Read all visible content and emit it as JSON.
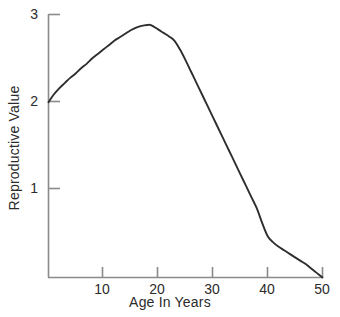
{
  "chart_data": {
    "type": "line",
    "title": "",
    "xlabel": "Age In Years",
    "ylabel": "Reproductive Value",
    "xlim": [
      0,
      50
    ],
    "ylim": [
      0,
      3
    ],
    "grid": false,
    "legend": null,
    "line_color": "#2e2e2e",
    "axis_color": "#8a8a8a",
    "background_color": "#ffffff",
    "xticks": [
      10,
      20,
      30,
      40,
      50
    ],
    "xtick_labels": [
      "10",
      "20",
      "30",
      "40",
      "50"
    ],
    "yticks": [
      1,
      2,
      3
    ],
    "ytick_labels": [
      "1",
      "2",
      "3"
    ],
    "series": [
      {
        "name": "Reproductive Value",
        "x": [
          0,
          1,
          2,
          3,
          4,
          5,
          6,
          7,
          8,
          9,
          10,
          11,
          12,
          13,
          14,
          15,
          16,
          17,
          18,
          18.7,
          20,
          21,
          22,
          23,
          24,
          25,
          26,
          27,
          28,
          29,
          30,
          31,
          32,
          33,
          34,
          35,
          36,
          37,
          38,
          39,
          40,
          41,
          42,
          43,
          44,
          45,
          46,
          47,
          48,
          49,
          50
        ],
        "y": [
          2.0,
          2.09,
          2.16,
          2.22,
          2.28,
          2.33,
          2.39,
          2.44,
          2.5,
          2.55,
          2.6,
          2.65,
          2.7,
          2.74,
          2.78,
          2.82,
          2.85,
          2.87,
          2.88,
          2.88,
          2.83,
          2.79,
          2.75,
          2.7,
          2.6,
          2.48,
          2.35,
          2.22,
          2.09,
          1.96,
          1.83,
          1.7,
          1.57,
          1.44,
          1.31,
          1.18,
          1.05,
          0.92,
          0.79,
          0.62,
          0.47,
          0.4,
          0.35,
          0.31,
          0.27,
          0.23,
          0.19,
          0.15,
          0.1,
          0.05,
          0.0
        ]
      }
    ]
  },
  "axis_titles": {
    "x": "Age In Years",
    "y": "Reproductive Value"
  }
}
